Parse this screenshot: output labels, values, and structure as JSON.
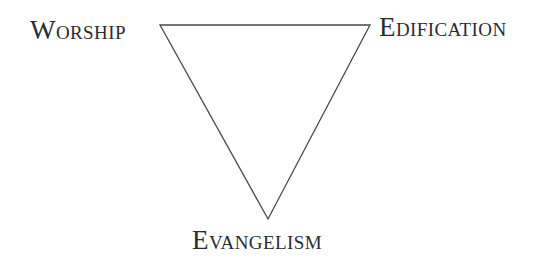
{
  "diagram": {
    "type": "inverted-triangle",
    "background_color": "#ffffff",
    "stroke_color": "#46464c",
    "text_color": "#2b2b30",
    "stroke_width": 1.3,
    "vertices": [
      {
        "id": "worship",
        "x": 160,
        "y": 25,
        "label": "Worship"
      },
      {
        "id": "edification",
        "x": 370,
        "y": 25,
        "label": "Edification"
      },
      {
        "id": "evangelism",
        "x": 268,
        "y": 219,
        "label": "Evangelism"
      }
    ],
    "edges": [
      {
        "from": "worship",
        "to": "edification"
      },
      {
        "from": "edification",
        "to": "evangelism"
      },
      {
        "from": "evangelism",
        "to": "worship"
      }
    ],
    "labels": {
      "worship": {
        "text": "Worship",
        "lead": "W",
        "rest": "orship"
      },
      "edification": {
        "text": "Edification",
        "lead": "E",
        "rest": "dification"
      },
      "evangelism": {
        "text": "Evangelism",
        "lead": "E",
        "rest": "vangelism"
      }
    }
  }
}
